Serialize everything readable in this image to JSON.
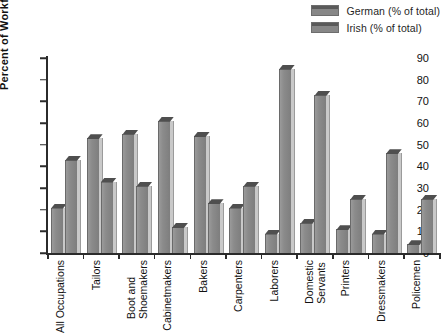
{
  "chart_data": {
    "type": "bar",
    "title": "",
    "xlabel": "",
    "ylabel": "Percent of Workforce",
    "ylim": [
      0,
      90
    ],
    "yticks": [
      0,
      10,
      20,
      30,
      40,
      50,
      60,
      70,
      80,
      90
    ],
    "grid": false,
    "legend_position": "top-right",
    "categories": [
      "All Occupations",
      "Tailors",
      "Boot and Shoemakers",
      "Cabinetmakers",
      "Bakers",
      "Carpenters",
      "Laborers",
      "Domestic Servants",
      "Printers",
      "Dressmakers",
      "Policemen"
    ],
    "category_lines": [
      [
        "All Occupations"
      ],
      [
        "Tailors"
      ],
      [
        "Boot and",
        "Shoemakers"
      ],
      [
        "Cabinetmakers"
      ],
      [
        "Bakers"
      ],
      [
        "Carpenters"
      ],
      [
        "Laborers"
      ],
      [
        "Domestic",
        "Servants"
      ],
      [
        "Printers"
      ],
      [
        "Dressmakers"
      ],
      [
        "Policemen"
      ]
    ],
    "series": [
      {
        "name": "German (% of total)",
        "color": "#8a8a8a",
        "values": [
          21,
          53,
          55,
          61,
          54,
          21,
          9,
          14,
          11,
          9,
          4
        ]
      },
      {
        "name": "Irish (% of total)",
        "color": "#8a8a8a",
        "values": [
          43,
          33,
          31,
          12,
          23,
          31,
          85,
          73,
          25,
          46,
          25
        ]
      }
    ]
  },
  "legend": {
    "items": [
      {
        "label": "German (% of total)"
      },
      {
        "label": "Irish (% of total)"
      }
    ]
  },
  "axes": {
    "y_title": "Percent of Workforce"
  },
  "colors": {
    "bar_face": "#8a8a8a",
    "bar_top": "#4f4f4f",
    "bar_side": "#c9c9c9",
    "axis": "#2b2b2b",
    "background": "#ffffff"
  }
}
